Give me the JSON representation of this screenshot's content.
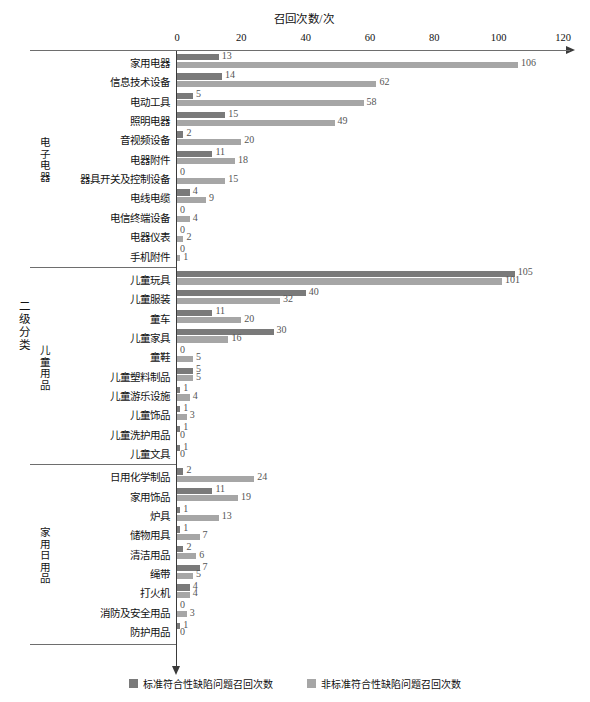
{
  "chart_data": {
    "type": "bar",
    "orientation": "horizontal",
    "title": "召回次数/次",
    "xlabel": "召回次数/次",
    "ylabel": "二级分类",
    "xlim": [
      0,
      120
    ],
    "xticks": [
      "0",
      "20",
      "40",
      "60",
      "80",
      "100",
      "120"
    ],
    "grid": false,
    "legend_position": "bottom-center",
    "series": [
      {
        "name": "标准符合性缺陷问题召回次数",
        "color": "#7a7a7a"
      },
      {
        "name": "非标准符合性缺陷问题召回次数",
        "color": "#a6a6a6"
      }
    ],
    "groups": [
      {
        "name": "电子电器",
        "categories": [
          "家用电器",
          "信息技术设备",
          "电动工具",
          "照明电器",
          "音视频设备",
          "电器附件",
          "器具开关及控制设备",
          "电线电缆",
          "电信终端设备",
          "电器仪表",
          "手机附件"
        ],
        "series_values": [
          [
            13,
            14,
            5,
            15,
            2,
            11,
            0,
            4,
            0,
            0,
            0
          ],
          [
            106,
            62,
            58,
            49,
            20,
            18,
            15,
            9,
            4,
            2,
            1
          ]
        ]
      },
      {
        "name": "儿童用品",
        "categories": [
          "儿童玩具",
          "儿童服装",
          "童车",
          "儿童家具",
          "童鞋",
          "儿童塑料制品",
          "儿童游乐设施",
          "儿童饰品",
          "儿童洗护用品",
          "儿童文具"
        ],
        "series_values": [
          [
            105,
            40,
            11,
            30,
            0,
            5,
            1,
            1,
            1,
            1
          ],
          [
            101,
            32,
            20,
            16,
            5,
            5,
            4,
            3,
            0,
            0
          ]
        ]
      },
      {
        "name": "家用日用品",
        "categories": [
          "日用化学制品",
          "家用饰品",
          "炉具",
          "储物用具",
          "清洁用品",
          "绳带",
          "打火机",
          "消防及安全用品",
          "防护用品"
        ],
        "series_values": [
          [
            2,
            11,
            1,
            1,
            2,
            7,
            4,
            0,
            1
          ],
          [
            24,
            19,
            13,
            7,
            6,
            5,
            4,
            3,
            0
          ]
        ]
      }
    ]
  }
}
